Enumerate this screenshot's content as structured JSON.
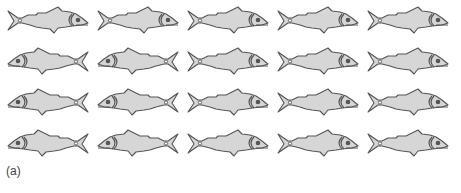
{
  "figure": {
    "label": "(a)",
    "fill_color": "#d6d6d6",
    "outline_color": "#555555",
    "rows": [
      {
        "fish": [
          "right",
          "right",
          "right",
          "right",
          "right"
        ]
      },
      {
        "fish": [
          "left",
          "left",
          "right",
          "right",
          "right"
        ]
      },
      {
        "fish": [
          "left",
          "left",
          "right",
          "right",
          "right"
        ]
      },
      {
        "fish": [
          "left",
          "left",
          "right",
          "right",
          "right"
        ]
      }
    ]
  }
}
